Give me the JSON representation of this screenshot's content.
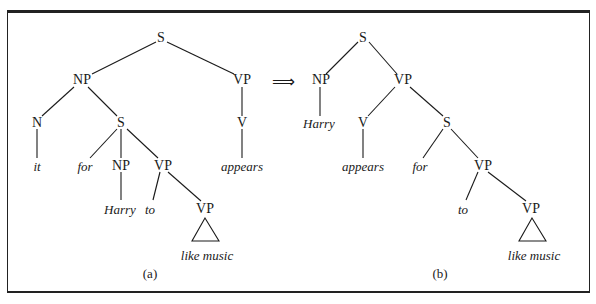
{
  "figure": {
    "arrow_symbol": "⟹",
    "tree_a": {
      "caption": "(a)",
      "nodes": {
        "S_root": "S",
        "NP": "NP",
        "VP": "VP",
        "N": "N",
        "S_emb": "S",
        "V": "V",
        "it": "it",
        "for": "for",
        "NP_emb": "NP",
        "VP_emb": "VP",
        "appears": "appears",
        "Harry": "Harry",
        "to": "to",
        "VP_low": "VP",
        "like_music": "like music"
      }
    },
    "tree_b": {
      "caption": "(b)",
      "nodes": {
        "S_root": "S",
        "NP": "NP",
        "VP": "VP",
        "Harry": "Harry",
        "V": "V",
        "S_emb": "S",
        "appears": "appears",
        "for": "for",
        "VP_emb": "VP",
        "to": "to",
        "VP_low": "VP",
        "like_music": "like music"
      }
    }
  }
}
